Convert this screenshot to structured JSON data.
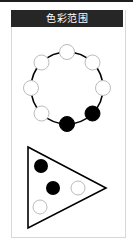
{
  "header": {
    "title": "色彩范围"
  },
  "colors": {
    "header_bg": "#262626",
    "node_filled": "#000000",
    "node_empty": "#ffffff",
    "edge": "#000000"
  },
  "ring_diagram": {
    "nodes": [
      {
        "position": "top",
        "filled": false
      },
      {
        "position": "top-right",
        "filled": false
      },
      {
        "position": "right",
        "filled": false
      },
      {
        "position": "bottom-right",
        "filled": true
      },
      {
        "position": "bottom",
        "filled": true
      },
      {
        "position": "bottom-left",
        "filled": false
      },
      {
        "position": "left",
        "filled": false
      },
      {
        "position": "top-left",
        "filled": false
      }
    ]
  },
  "triangle_diagram": {
    "nodes": [
      {
        "position": "top-left",
        "filled": true
      },
      {
        "position": "center",
        "filled": true
      },
      {
        "position": "right",
        "filled": false
      },
      {
        "position": "bottom-left",
        "filled": false
      }
    ]
  }
}
